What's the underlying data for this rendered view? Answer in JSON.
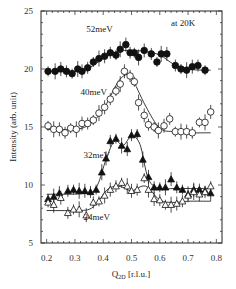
{
  "chart_data": {
    "type": "scatter",
    "title": "",
    "annotation": "at 20K",
    "xlabel": "Q",
    "xlabel_sub": "2D",
    "xlabel_unit": " [r.l.u.]",
    "ylabel": "Intensity (arb. unit)",
    "xlim": [
      0.18,
      0.82
    ],
    "ylim": [
      5,
      25
    ],
    "xticks": [
      0.2,
      0.3,
      0.4,
      0.5,
      0.6,
      0.7,
      0.8
    ],
    "xtick_labels": [
      "0.2",
      "0.3",
      "0.4",
      "0.5",
      "0.6",
      "0.7",
      "0.8"
    ],
    "yticks": [
      5,
      10,
      15,
      20,
      25
    ],
    "ytick_labels": [
      "5",
      "10",
      "15",
      "20",
      "25"
    ],
    "grid": false,
    "legend": "inline labels",
    "series": [
      {
        "name": "52meV",
        "marker": "filled-circle",
        "label_pos": [
          0.34,
          23.2
        ],
        "x": [
          0.205,
          0.23,
          0.25,
          0.27,
          0.29,
          0.31,
          0.325,
          0.345,
          0.365,
          0.385,
          0.405,
          0.425,
          0.445,
          0.46,
          0.48,
          0.495,
          0.51,
          0.525,
          0.545,
          0.57,
          0.59,
          0.605,
          0.625,
          0.655,
          0.675,
          0.695,
          0.715,
          0.735,
          0.76
        ],
        "y": [
          19.8,
          19.8,
          20.0,
          19.8,
          19.6,
          20.0,
          19.8,
          20.1,
          20.6,
          20.9,
          21.1,
          21.4,
          21.2,
          21.7,
          22.1,
          21.4,
          21.4,
          21.0,
          21.6,
          21.3,
          20.6,
          21.3,
          21.3,
          20.3,
          20.0,
          19.9,
          20.2,
          20.3,
          19.9
        ],
        "fit_x": [
          0.2,
          0.3,
          0.35,
          0.4,
          0.45,
          0.5,
          0.55,
          0.6,
          0.65,
          0.7,
          0.75,
          0.78
        ],
        "fit_y": [
          19.8,
          19.8,
          20.1,
          20.9,
          21.5,
          21.6,
          21.5,
          21.2,
          20.4,
          20.0,
          19.9,
          19.9
        ]
      },
      {
        "name": "40meV",
        "marker": "open-circle",
        "label_pos": [
          0.32,
          17.8
        ],
        "x": [
          0.205,
          0.225,
          0.245,
          0.265,
          0.285,
          0.305,
          0.325,
          0.345,
          0.365,
          0.385,
          0.405,
          0.425,
          0.445,
          0.46,
          0.475,
          0.495,
          0.51,
          0.525,
          0.545,
          0.56,
          0.58,
          0.595,
          0.615,
          0.635,
          0.655,
          0.675,
          0.695,
          0.715,
          0.74,
          0.76,
          0.78
        ],
        "y": [
          15.1,
          14.8,
          14.8,
          14.5,
          14.9,
          14.8,
          15.3,
          15.3,
          15.6,
          16.2,
          16.7,
          17.4,
          18.1,
          18.7,
          19.8,
          19.4,
          18.9,
          17.1,
          16.0,
          15.2,
          15.0,
          14.7,
          15.1,
          15.7,
          14.6,
          14.6,
          14.6,
          14.5,
          15.4,
          15.4,
          16.3
        ],
        "fit_x": [
          0.2,
          0.3,
          0.35,
          0.4,
          0.45,
          0.48,
          0.5,
          0.55,
          0.6,
          0.65,
          0.7,
          0.78
        ],
        "fit_y": [
          14.8,
          14.8,
          15.2,
          16.5,
          18.8,
          19.5,
          19.3,
          16.8,
          14.9,
          14.6,
          14.5,
          14.5
        ]
      },
      {
        "name": "32meV",
        "marker": "filled-triangle",
        "label_pos": [
          0.33,
          12.3
        ],
        "x": [
          0.205,
          0.225,
          0.245,
          0.275,
          0.295,
          0.315,
          0.335,
          0.355,
          0.375,
          0.395,
          0.41,
          0.425,
          0.445,
          0.465,
          0.485,
          0.5,
          0.52,
          0.54,
          0.56,
          0.58,
          0.6,
          0.62,
          0.64,
          0.66,
          0.68,
          0.7,
          0.72,
          0.74,
          0.76,
          0.78
        ],
        "y": [
          8.8,
          9.0,
          9.3,
          9.5,
          9.6,
          9.5,
          9.5,
          9.4,
          9.6,
          11.1,
          12.3,
          13.8,
          14.0,
          13.4,
          13.1,
          14.3,
          14.4,
          12.2,
          10.7,
          9.8,
          9.8,
          9.8,
          10.5,
          9.8,
          9.6,
          9.2,
          9.6,
          9.6,
          9.5,
          9.3
        ],
        "fit_x": [
          0.2,
          0.35,
          0.38,
          0.41,
          0.44,
          0.47,
          0.5,
          0.53,
          0.56,
          0.6,
          0.65,
          0.7,
          0.78
        ],
        "fit_y": [
          9.2,
          9.3,
          10.0,
          12.2,
          13.8,
          13.4,
          14.2,
          13.5,
          10.5,
          9.7,
          9.7,
          9.7,
          9.7
        ]
      },
      {
        "name": "24meV",
        "marker": "open-triangle",
        "label_pos": [
          0.33,
          7.0
        ],
        "x": [
          0.205,
          0.225,
          0.25,
          0.275,
          0.295,
          0.315,
          0.34,
          0.365,
          0.385,
          0.405,
          0.425,
          0.445,
          0.465,
          0.485,
          0.5,
          0.52,
          0.545,
          0.56,
          0.58,
          0.6,
          0.62,
          0.64,
          0.66,
          0.68,
          0.7,
          0.72,
          0.74,
          0.76,
          0.78
        ],
        "y": [
          8.5,
          8.3,
          8.9,
          7.6,
          7.9,
          7.9,
          7.4,
          8.5,
          8.6,
          9.1,
          9.6,
          9.9,
          10.2,
          9.9,
          9.5,
          9.6,
          10.6,
          9.6,
          8.8,
          8.7,
          8.3,
          8.3,
          8.4,
          8.6,
          9.1,
          9.4,
          9.2,
          9.4,
          9.9
        ],
        "fit_x": [
          0.2,
          0.3,
          0.35,
          0.38,
          0.41,
          0.44,
          0.47,
          0.5,
          0.55,
          0.6,
          0.65,
          0.7,
          0.78
        ],
        "fit_y": [
          7.8,
          7.8,
          7.9,
          8.5,
          9.5,
          9.9,
          9.8,
          9.5,
          9.9,
          8.7,
          8.5,
          8.6,
          8.6
        ]
      }
    ]
  }
}
